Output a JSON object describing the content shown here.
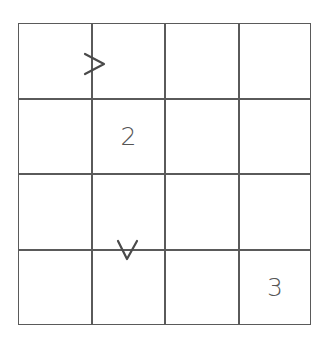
{
  "puzzle": {
    "rows": 4,
    "cols": 4,
    "cells": [
      [
        "",
        "",
        "",
        ""
      ],
      [
        "",
        "2",
        "",
        ""
      ],
      [
        "",
        "",
        "",
        ""
      ],
      [
        "",
        "",
        "",
        "3"
      ]
    ],
    "constraints": [
      {
        "type": "horizontal",
        "row": 0,
        "between_cols": [
          0,
          1
        ],
        "symbol": ">"
      },
      {
        "type": "vertical",
        "col": 1,
        "between_rows": [
          2,
          3
        ],
        "symbol": "v"
      }
    ]
  }
}
